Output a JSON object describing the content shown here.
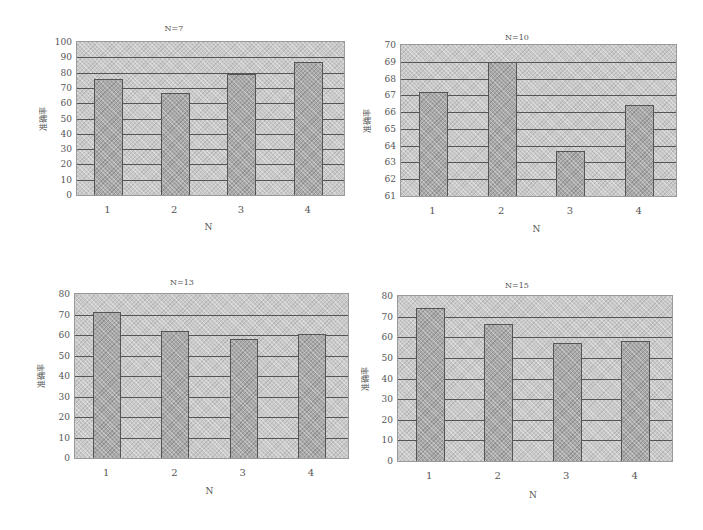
{
  "chart_data": [
    {
      "type": "bar",
      "title": "N=7",
      "xlabel": "N",
      "ylabel": "准确率",
      "categories": [
        "1",
        "2",
        "3",
        "4"
      ],
      "values": [
        76,
        67,
        79,
        87
      ],
      "ylim": [
        0,
        100
      ],
      "yticks": [
        "0",
        "10",
        "20",
        "30",
        "40",
        "50",
        "60",
        "70",
        "80",
        "90",
        "100"
      ],
      "grid": true,
      "legend": null
    },
    {
      "type": "bar",
      "title": "N=10",
      "xlabel": "N",
      "ylabel": "准确率",
      "categories": [
        "1",
        "2",
        "3",
        "4"
      ],
      "values": [
        67.2,
        69,
        63.7,
        66.4
      ],
      "ylim": [
        61,
        70
      ],
      "yticks": [
        "61",
        "62",
        "63",
        "64",
        "65",
        "66",
        "67",
        "68",
        "69",
        "70"
      ],
      "grid": true,
      "legend": null
    },
    {
      "type": "bar",
      "title": "N=13",
      "xlabel": "N",
      "ylabel": "准确率",
      "categories": [
        "1",
        "2",
        "3",
        "4"
      ],
      "values": [
        71,
        62,
        58,
        60.5
      ],
      "ylim": [
        0,
        80
      ],
      "yticks": [
        "0",
        "10",
        "20",
        "30",
        "40",
        "50",
        "60",
        "70",
        "80"
      ],
      "grid": true,
      "legend": null
    },
    {
      "type": "bar",
      "title": "N=15",
      "xlabel": "N",
      "ylabel": "准确率",
      "categories": [
        "1",
        "2",
        "3",
        "4"
      ],
      "values": [
        74,
        66.5,
        57,
        58
      ],
      "ylim": [
        0,
        80
      ],
      "yticks": [
        "0",
        "10",
        "20",
        "30",
        "40",
        "50",
        "60",
        "70",
        "80"
      ],
      "grid": true,
      "legend": null
    }
  ],
  "layout": [
    {
      "plot": {
        "x": 76,
        "y": 41,
        "w": 269,
        "h": 155
      },
      "title_pos": {
        "x": 174,
        "y": 24
      },
      "bar_w": 29,
      "xlabel_y": 222,
      "ylabel_x": 30
    },
    {
      "plot": {
        "x": 400,
        "y": 44,
        "w": 277,
        "h": 153
      },
      "title_pos": {
        "x": 517,
        "y": 33
      },
      "bar_w": 29,
      "xlabel_y": 224,
      "ylabel_x": 354
    },
    {
      "plot": {
        "x": 74,
        "y": 293,
        "w": 275,
        "h": 166
      },
      "title_pos": {
        "x": 182,
        "y": 278
      },
      "bar_w": 28,
      "xlabel_y": 486,
      "ylabel_x": 28
    },
    {
      "plot": {
        "x": 397,
        "y": 295,
        "w": 276,
        "h": 167
      },
      "title_pos": {
        "x": 517,
        "y": 281
      },
      "bar_w": 29,
      "xlabel_y": 490,
      "ylabel_x": 352
    }
  ]
}
